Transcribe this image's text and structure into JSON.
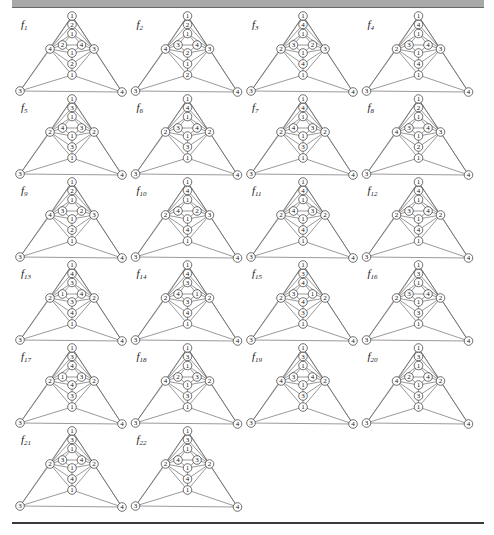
{
  "figure": {
    "header_text": "",
    "layout": {
      "columns": 4,
      "col_pitch": 115.5,
      "row_pitch": 83,
      "origin_x": 72,
      "origin_y": 16
    },
    "colors": {
      "header_bar": "#a9a9a9",
      "rule": "#3a3a3a",
      "edge": "#555555",
      "node_stroke": "#333333"
    },
    "node_slots": [
      "top",
      "upper",
      "mid_upper",
      "inner_left",
      "inner_right",
      "left",
      "right",
      "center",
      "lower",
      "bottom_center",
      "bottom_left",
      "bottom_right"
    ],
    "graphs": [
      {
        "name": "f",
        "sub": "1",
        "labels": [
          1,
          2,
          1,
          2,
          4,
          4,
          3,
          1,
          2,
          1,
          3,
          4
        ]
      },
      {
        "name": "f",
        "sub": "2",
        "labels": [
          1,
          2,
          1,
          3,
          4,
          4,
          3,
          2,
          1,
          2,
          3,
          4
        ]
      },
      {
        "name": "f",
        "sub": "3",
        "labels": [
          1,
          4,
          1,
          3,
          2,
          2,
          3,
          1,
          4,
          1,
          3,
          4
        ]
      },
      {
        "name": "f",
        "sub": "4",
        "labels": [
          1,
          4,
          1,
          3,
          4,
          2,
          3,
          1,
          4,
          1,
          3,
          4
        ]
      },
      {
        "name": "f",
        "sub": "5",
        "labels": [
          1,
          3,
          1,
          4,
          3,
          2,
          2,
          1,
          3,
          1,
          3,
          4
        ]
      },
      {
        "name": "f",
        "sub": "6",
        "labels": [
          1,
          4,
          1,
          3,
          4,
          2,
          2,
          1,
          3,
          1,
          3,
          4
        ]
      },
      {
        "name": "f",
        "sub": "7",
        "labels": [
          1,
          4,
          1,
          4,
          3,
          2,
          2,
          1,
          3,
          1,
          3,
          4
        ]
      },
      {
        "name": "f",
        "sub": "8",
        "labels": [
          1,
          2,
          1,
          3,
          4,
          4,
          3,
          1,
          2,
          1,
          3,
          4
        ]
      },
      {
        "name": "f",
        "sub": "9",
        "labels": [
          1,
          2,
          1,
          3,
          2,
          4,
          3,
          1,
          2,
          1,
          3,
          4
        ]
      },
      {
        "name": "f",
        "sub": "10",
        "labels": [
          1,
          4,
          1,
          4,
          2,
          2,
          3,
          1,
          4,
          1,
          3,
          4
        ]
      },
      {
        "name": "f",
        "sub": "11",
        "labels": [
          1,
          4,
          1,
          4,
          3,
          2,
          2,
          1,
          4,
          1,
          3,
          4
        ]
      },
      {
        "name": "f",
        "sub": "12",
        "labels": [
          1,
          4,
          1,
          3,
          4,
          2,
          2,
          1,
          4,
          1,
          3,
          4
        ]
      },
      {
        "name": "f",
        "sub": "13",
        "labels": [
          1,
          4,
          3,
          1,
          4,
          2,
          2,
          3,
          4,
          1,
          3,
          4
        ]
      },
      {
        "name": "f",
        "sub": "14",
        "labels": [
          1,
          4,
          3,
          4,
          1,
          2,
          2,
          3,
          4,
          1,
          3,
          4
        ]
      },
      {
        "name": "f",
        "sub": "15",
        "labels": [
          1,
          3,
          4,
          3,
          1,
          2,
          2,
          4,
          3,
          1,
          3,
          4
        ]
      },
      {
        "name": "f",
        "sub": "16",
        "labels": [
          1,
          3,
          1,
          3,
          4,
          2,
          2,
          1,
          3,
          1,
          3,
          4
        ]
      },
      {
        "name": "f",
        "sub": "17",
        "labels": [
          1,
          3,
          4,
          1,
          3,
          2,
          2,
          4,
          3,
          1,
          3,
          4
        ]
      },
      {
        "name": "f",
        "sub": "18",
        "labels": [
          1,
          3,
          1,
          2,
          3,
          4,
          2,
          1,
          3,
          1,
          3,
          4
        ]
      },
      {
        "name": "f",
        "sub": "19",
        "labels": [
          1,
          3,
          1,
          3,
          4,
          4,
          2,
          1,
          3,
          1,
          3,
          4
        ]
      },
      {
        "name": "f",
        "sub": "20",
        "labels": [
          1,
          3,
          1,
          2,
          4,
          4,
          2,
          1,
          3,
          1,
          3,
          4
        ]
      },
      {
        "name": "f",
        "sub": "21",
        "labels": [
          1,
          3,
          1,
          3,
          4,
          2,
          2,
          1,
          4,
          1,
          3,
          4
        ]
      },
      {
        "name": "f",
        "sub": "22",
        "labels": [
          1,
          3,
          1,
          4,
          3,
          2,
          2,
          1,
          4,
          1,
          3,
          4
        ]
      }
    ]
  }
}
